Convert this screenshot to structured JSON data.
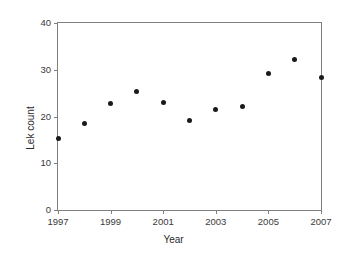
{
  "chart_data": {
    "type": "scatter",
    "title": "",
    "xlabel": "Year",
    "ylabel": "Lek count",
    "x": [
      1997,
      1998,
      1999,
      2000,
      2001,
      2002,
      2003,
      2004,
      2005,
      2006,
      2007
    ],
    "values": [
      15.3,
      18.6,
      22.7,
      25.3,
      23.0,
      19.2,
      21.5,
      22.1,
      29.3,
      32.2,
      28.4
    ],
    "series": [
      {
        "name": "Lek count",
        "values": [
          15.3,
          18.6,
          22.7,
          25.3,
          23.0,
          19.2,
          21.5,
          22.1,
          29.3,
          32.2,
          28.4
        ]
      }
    ],
    "xlim": [
      1997,
      2007
    ],
    "ylim": [
      0,
      40
    ],
    "xticks": [
      1997,
      1999,
      2001,
      2003,
      2005,
      2007
    ],
    "xtick_labels": [
      "1997",
      "1999",
      "2001",
      "2003",
      "2005",
      "2007"
    ],
    "yticks": [
      0,
      10,
      20,
      30,
      40
    ],
    "ytick_labels": [
      "0",
      "10",
      "20",
      "30",
      "40"
    ],
    "grid": false,
    "legend": false,
    "marker_color": "#1a1a1a",
    "axis_color": "#808080"
  }
}
